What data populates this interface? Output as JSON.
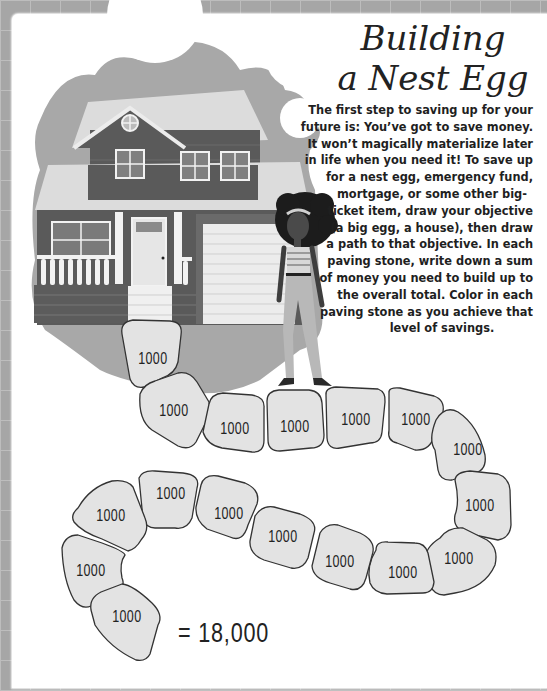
{
  "page": {
    "title_line1": "Building",
    "title_line2": "a Nest Egg",
    "body_lines": [
      "The first step to saving up for your",
      "future is: You’ve got to save money.",
      "It won’t magically materialize later",
      "in life when you need it! To save up",
      "for a nest egg, emergency fund,",
      "mortgage, or some other big-",
      "ticket item, draw your objective",
      "(a big egg, a house), then draw",
      "a path to that objective. In each",
      "paving stone, write down a sum",
      "of money you need to build up to",
      "the overall total. Color in each",
      "paving stone as you achieve that",
      "level of savings."
    ]
  },
  "illustration": {
    "house": "house-illustration",
    "person": "woman-illustration",
    "colors": {
      "background_blob": "#a8a8a8",
      "roof": "#dcdcdc",
      "siding_dark": "#5a5a5a",
      "trim": "#f2f2f2",
      "stone_fill": "#e3e3e3",
      "stone_stroke": "#333333"
    }
  },
  "path": {
    "stones": [
      {
        "label": "1000"
      },
      {
        "label": "1000"
      },
      {
        "label": "1000"
      },
      {
        "label": "1000"
      },
      {
        "label": "1000"
      },
      {
        "label": "1000"
      },
      {
        "label": "1000"
      },
      {
        "label": "1000"
      },
      {
        "label": "1000"
      },
      {
        "label": "1000"
      },
      {
        "label": "1000"
      },
      {
        "label": "1000"
      },
      {
        "label": "1000"
      },
      {
        "label": "1000"
      },
      {
        "label": "1000"
      },
      {
        "label": "1000"
      },
      {
        "label": "1000"
      },
      {
        "label": "1000"
      }
    ],
    "total": "= 18,000"
  }
}
